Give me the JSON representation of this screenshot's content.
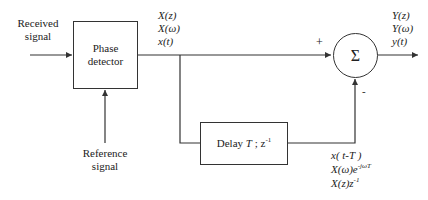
{
  "diagram": {
    "inputs": {
      "received_signal": [
        "Received",
        "signal"
      ],
      "reference_signal": [
        "Reference",
        "signal"
      ]
    },
    "blocks": {
      "phase_detector": [
        "Phase",
        "detector"
      ],
      "delay": {
        "label": "Delay ",
        "T": "T",
        "sep": " ; z",
        "exp": "-1"
      },
      "summer": {
        "symbol": "Σ",
        "plus": "+",
        "minus": "-"
      }
    },
    "signals": {
      "x_labels": [
        "X(z)",
        "X(ω)",
        "x(t)"
      ],
      "y_labels": [
        "Y(z)",
        "Y(ω)",
        "y(t)"
      ],
      "delayed_labels": {
        "line1": "x( t-T )",
        "line2_base": "X(ω)e",
        "line2_exp": "-jωT",
        "line3_base": "X(z)z",
        "line3_exp": "-1"
      }
    },
    "colors": {
      "stroke": "#333333",
      "background": "#ffffff"
    }
  }
}
